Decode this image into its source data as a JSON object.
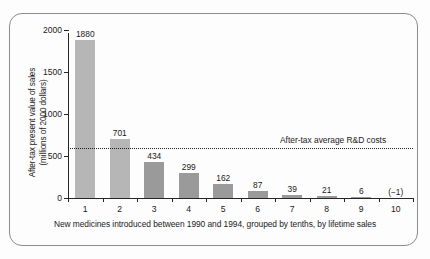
{
  "chart_data": {
    "type": "bar",
    "title": "",
    "xlabel": "New medicines introduced between 1990 and 1994, grouped by tenths, by lifetime sales",
    "ylabel_line1": "After-tax present value of sales",
    "ylabel_line2": "(millions of 2000 dollars)",
    "categories": [
      "1",
      "2",
      "3",
      "4",
      "5",
      "6",
      "7",
      "8",
      "9",
      "10"
    ],
    "values": [
      1880,
      701,
      434,
      299,
      162,
      87,
      39,
      21,
      6,
      -1
    ],
    "value_labels": [
      "1880",
      "701",
      "434",
      "299",
      "162",
      "87",
      "39",
      "21",
      "6",
      "(−1)"
    ],
    "bar_colors": [
      "#b6b6b6",
      "#b6b6b6",
      "#9a9a9a",
      "#9a9a9a",
      "#9a9a9a",
      "#9a9a9a",
      "#9a9a9a",
      "#9a9a9a",
      "#9a9a9a",
      "#9a9a9a"
    ],
    "ylim": [
      0,
      2000
    ],
    "yticks": [
      0,
      500,
      1000,
      1500,
      2000
    ],
    "ytick_labels": [
      "0",
      "500",
      "1000",
      "1500",
      "2000"
    ],
    "grid": false,
    "legend": "none",
    "annotations": [
      {
        "name": "rd-cost-reference-line",
        "label": "After-tax average R&D costs",
        "value": 590,
        "style": "dotted-horizontal-line"
      }
    ]
  },
  "figure": {
    "frame_color": "#8b8b8b",
    "axis_color": "#262626",
    "background": "#fdfdfd"
  }
}
